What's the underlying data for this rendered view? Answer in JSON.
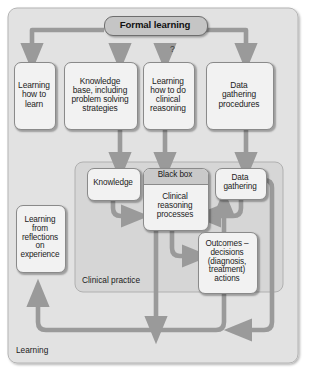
{
  "diagram": {
    "title_node": {
      "label": "Formal learning"
    },
    "question_marker": "?",
    "tier1": [
      {
        "name": "learning-how-to-learn",
        "label": "Learning\nhow to\nlearn"
      },
      {
        "name": "knowledge-base",
        "label": "Knowledge\nbase, including\nproblem solving\nstrategies"
      },
      {
        "name": "learning-clinical-reasoning",
        "label": "Learning\nhow to do\nclinical\nreasoning"
      },
      {
        "name": "data-gathering-procedures",
        "label": "Data\ngathering\nprocedures"
      }
    ],
    "practice": {
      "panel_label": "Clinical practice",
      "nodes": [
        {
          "name": "knowledge",
          "label": "Knowledge"
        },
        {
          "name": "black-box",
          "header": "Black box",
          "label": "Clinical\nreasoning\nprocesses"
        },
        {
          "name": "data-gathering",
          "label": "Data\ngathering"
        },
        {
          "name": "outcomes",
          "label": "Outcomes –\ndecisions\n(diagnosis,\ntreatment)\nactions"
        }
      ]
    },
    "reflection_node": {
      "label": "Learning\nfrom\nreflections\non\nexperience"
    },
    "outer_panel_label": "Learning",
    "colors": {
      "arrow": "#9a9a9a",
      "outer_panel_fill": "#e2e2e2",
      "inner_panel_fill": "#d6d6d6",
      "node_fill": "#f2f2f2",
      "header_fill": "#c9c9c9",
      "title_fill": "#c5c5c5",
      "stroke": "#8a8a8a",
      "text": "#1b1b1b"
    }
  }
}
